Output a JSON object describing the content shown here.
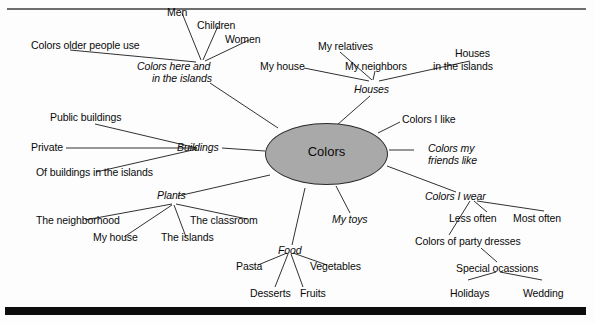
{
  "diagram": {
    "title_node": "Colors",
    "type": "mind-map",
    "central": {
      "label": "Colors",
      "shape": "ellipse",
      "fill_color": "#a9a9a9",
      "border_color": "#2a2a2a"
    },
    "branches": [
      {
        "id": "colors-here-islands",
        "label_line1": "Colors here and",
        "label_line2": "in the islands",
        "style": "italic",
        "children": [
          {
            "id": "men",
            "label": "Men"
          },
          {
            "id": "children",
            "label": "Children"
          },
          {
            "id": "women",
            "label": "Women"
          },
          {
            "id": "colors-older-people-use",
            "label": "Colors older people use"
          }
        ]
      },
      {
        "id": "houses",
        "label": "Houses",
        "style": "italic",
        "children": [
          {
            "id": "my-relatives",
            "label": "My relatives"
          },
          {
            "id": "my-house-houses",
            "label": "My house"
          },
          {
            "id": "my-neighbors",
            "label": "My neighbors"
          },
          {
            "id": "houses-in-the-islands-line1",
            "label": "Houses"
          },
          {
            "id": "houses-in-the-islands-line2",
            "label": "in the islands"
          }
        ]
      },
      {
        "id": "buildings",
        "label": "Buildings",
        "style": "italic",
        "children": [
          {
            "id": "public-buildings",
            "label": "Public buildings"
          },
          {
            "id": "private",
            "label": "Private"
          },
          {
            "id": "of-buildings-in-the-islands",
            "label": "Of buildings in the islands"
          }
        ]
      },
      {
        "id": "plants",
        "label": "Plants",
        "style": "italic",
        "children": [
          {
            "id": "the-neighborhood",
            "label": "The neighborhood"
          },
          {
            "id": "my-house-plants",
            "label": "My house"
          },
          {
            "id": "the-islands",
            "label": "The islands"
          },
          {
            "id": "the-classroom",
            "label": "The classroom"
          }
        ]
      },
      {
        "id": "food",
        "label": "Food",
        "style": "italic",
        "children": [
          {
            "id": "pasta",
            "label": "Pasta"
          },
          {
            "id": "desserts",
            "label": "Desserts"
          },
          {
            "id": "fruits",
            "label": "Fruits"
          },
          {
            "id": "vegetables",
            "label": "Vegetables"
          }
        ]
      },
      {
        "id": "my-toys",
        "label": "My toys",
        "style": "italic",
        "children": []
      },
      {
        "id": "colors-i-like",
        "label": "Colors I like",
        "style": "normal",
        "children": []
      },
      {
        "id": "colors-my-friends-like",
        "label_line1": "Colors my",
        "label_line2": "friends like",
        "style": "italic",
        "children": []
      },
      {
        "id": "colors-i-wear",
        "label": "Colors I wear",
        "style": "italic",
        "children": [
          {
            "id": "less-often",
            "label": "Less often"
          },
          {
            "id": "most-often",
            "label": "Most often"
          },
          {
            "id": "colors-of-party-dresses",
            "label": "Colors of party dresses"
          },
          {
            "id": "special-ocassions",
            "label": "Special ocassions"
          },
          {
            "id": "holidays",
            "label": "Holidays"
          },
          {
            "id": "wedding",
            "label": "Wedding"
          }
        ]
      }
    ]
  }
}
